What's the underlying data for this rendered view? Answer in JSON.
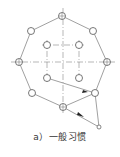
{
  "diagram": {
    "caption": "a）一般习惯",
    "colors": {
      "line": "#777777",
      "circle": "#555555",
      "arrow": "#222222",
      "background": "#ffffff"
    },
    "outer_holes": [
      {
        "x": 62,
        "y": 16
      },
      {
        "x": 93,
        "y": 31
      },
      {
        "x": 107,
        "y": 62
      },
      {
        "x": 95,
        "y": 93
      },
      {
        "x": 63,
        "y": 107
      },
      {
        "x": 32,
        "y": 93
      },
      {
        "x": 19,
        "y": 62
      },
      {
        "x": 31,
        "y": 31
      }
    ],
    "inner_holes": [
      {
        "x": 47,
        "y": 45
      },
      {
        "x": 79,
        "y": 45
      },
      {
        "x": 79,
        "y": 78
      },
      {
        "x": 47,
        "y": 78
      }
    ],
    "start_point": {
      "x": 99,
      "y": 127
    },
    "center": {
      "x": 63,
      "y": 62
    }
  }
}
